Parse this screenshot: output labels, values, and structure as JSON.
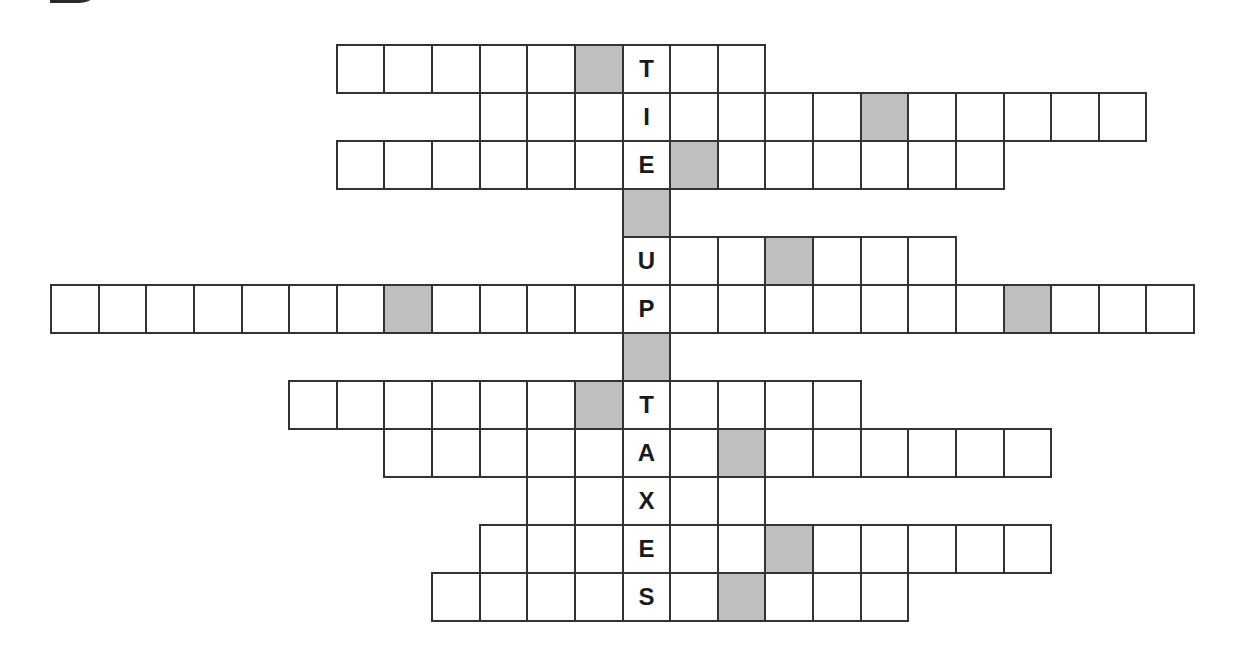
{
  "puzzle": {
    "type": "crossword",
    "hidden_phrase": "TIE UP TAXES",
    "key_column": 12,
    "colors": {
      "border": "#333333",
      "shaded": "#bfbfbf",
      "cell": "#ffffff",
      "letter": "#1a1a1a"
    },
    "rows": [
      {
        "start": 6,
        "end": 14,
        "shaded": [
          11
        ],
        "letters": {
          "12": "T"
        }
      },
      {
        "start": 9,
        "end": 22,
        "shaded": [
          17
        ],
        "letters": {
          "12": "I"
        }
      },
      {
        "start": 6,
        "end": 19,
        "shaded": [
          13
        ],
        "letters": {
          "12": "E"
        }
      },
      {
        "start": 12,
        "end": 12,
        "shaded": [
          12
        ],
        "letters": {}
      },
      {
        "start": 12,
        "end": 18,
        "shaded": [
          15
        ],
        "letters": {
          "12": "U"
        }
      },
      {
        "start": 0,
        "end": 23,
        "shaded": [
          7,
          20
        ],
        "letters": {
          "12": "P"
        }
      },
      {
        "start": 12,
        "end": 12,
        "shaded": [
          12
        ],
        "letters": {}
      },
      {
        "start": 5,
        "end": 16,
        "shaded": [
          11
        ],
        "letters": {
          "12": "T"
        }
      },
      {
        "start": 7,
        "end": 20,
        "shaded": [
          14
        ],
        "letters": {
          "12": "A"
        }
      },
      {
        "start": 10,
        "end": 14,
        "shaded": [],
        "letters": {
          "12": "X"
        }
      },
      {
        "start": 9,
        "end": 20,
        "shaded": [
          15
        ],
        "letters": {
          "12": "E"
        }
      },
      {
        "start": 8,
        "end": 17,
        "shaded": [
          14
        ],
        "letters": {
          "12": "S"
        }
      }
    ]
  }
}
